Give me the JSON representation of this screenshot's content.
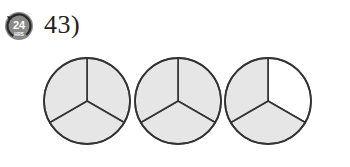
{
  "question": {
    "number_label": "43)",
    "badge": {
      "icon": "24-hours-icon",
      "main_text": "24",
      "sub_text": "HRS",
      "color": "#6b6b6b"
    }
  },
  "figure": {
    "shade_color": "#e6e6e6",
    "stroke_color": "#333333",
    "circles": [
      {
        "cx": 87,
        "cy": 101,
        "r": 43,
        "parts": 3,
        "shaded": [
          true,
          true,
          true
        ]
      },
      {
        "cx": 178,
        "cy": 101,
        "r": 43,
        "parts": 3,
        "shaded": [
          true,
          true,
          true
        ]
      },
      {
        "cx": 268,
        "cy": 101,
        "r": 43,
        "parts": 3,
        "shaded": [
          false,
          true,
          true
        ]
      }
    ],
    "shaded_parts_total": 8,
    "parts_per_whole": 3
  }
}
